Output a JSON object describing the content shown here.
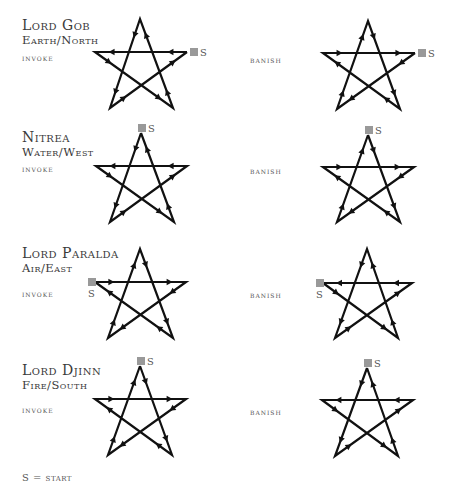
{
  "legend": "S = start",
  "start_marker": {
    "label": "S",
    "color": "#999999"
  },
  "line_color": "#111111",
  "rows": [
    {
      "title": "Lord Gob",
      "subtitle": "Earth/North",
      "invoke": {
        "label": "invoke",
        "start": "right",
        "path": [
          "right",
          "left",
          "br",
          "top",
          "bl",
          "right"
        ],
        "points": {
          "top": [
            140,
            19
          ],
          "left": [
            95,
            52
          ],
          "right": [
            187,
            52
          ],
          "bl": [
            110,
            108
          ],
          "br": [
            173,
            108
          ]
        },
        "s_pos": [
          190,
          48
        ],
        "s_text": [
          200,
          56
        ]
      },
      "banish": {
        "label": "banish",
        "start": "right",
        "path": [
          "right",
          "bl",
          "top",
          "br",
          "left",
          "right"
        ],
        "points": {
          "top": [
            368,
            21
          ],
          "left": [
            323,
            53
          ],
          "right": [
            415,
            53
          ],
          "bl": [
            337,
            109
          ],
          "br": [
            400,
            109
          ]
        },
        "s_pos": [
          418,
          49
        ],
        "s_text": [
          428,
          57
        ]
      }
    },
    {
      "title": "Nitrea",
      "subtitle": "Water/West",
      "invoke": {
        "label": "invoke",
        "start": "top",
        "path": [
          "top",
          "bl",
          "right",
          "left",
          "br",
          "top"
        ],
        "points": {
          "top": [
            141,
            133
          ],
          "left": [
            96,
            166
          ],
          "right": [
            187,
            166
          ],
          "bl": [
            110,
            222
          ],
          "br": [
            174,
            222
          ]
        },
        "s_pos": [
          138,
          124
        ],
        "s_text": [
          148,
          132
        ]
      },
      "banish": {
        "label": "banish",
        "start": "top",
        "path": [
          "top",
          "br",
          "left",
          "right",
          "bl",
          "top"
        ],
        "points": {
          "top": [
            368,
            135
          ],
          "left": [
            323,
            167
          ],
          "right": [
            414,
            167
          ],
          "bl": [
            337,
            222
          ],
          "br": [
            400,
            222
          ]
        },
        "s_pos": [
          365,
          126
        ],
        "s_text": [
          375,
          134
        ]
      }
    },
    {
      "title": "Lord Paralda",
      "subtitle": "Air/East",
      "invoke": {
        "label": "invoke",
        "start": "left",
        "path": [
          "left",
          "right",
          "bl",
          "top",
          "br",
          "left"
        ],
        "points": {
          "top": [
            140,
            249
          ],
          "left": [
            95,
            282
          ],
          "right": [
            186,
            282
          ],
          "bl": [
            108,
            338
          ],
          "br": [
            173,
            338
          ]
        },
        "s_pos": [
          88,
          278
        ],
        "s_text": [
          88,
          297
        ]
      },
      "banish": {
        "label": "banish",
        "start": "left",
        "path": [
          "left",
          "br",
          "top",
          "bl",
          "right",
          "left"
        ],
        "points": {
          "top": [
            367,
            249
          ],
          "left": [
            323,
            283
          ],
          "right": [
            412,
            283
          ],
          "bl": [
            335,
            338
          ],
          "br": [
            398,
            338
          ]
        },
        "s_pos": [
          316,
          279
        ],
        "s_text": [
          316,
          298
        ]
      }
    },
    {
      "title": "Lord Djinn",
      "subtitle": "Fire/South",
      "invoke": {
        "label": "invoke",
        "start": "top",
        "path": [
          "top",
          "br",
          "left",
          "right",
          "bl",
          "top"
        ],
        "points": {
          "top": [
            140,
            366
          ],
          "left": [
            95,
            399
          ],
          "right": [
            186,
            399
          ],
          "bl": [
            108,
            455
          ],
          "br": [
            172,
            455
          ]
        },
        "s_pos": [
          137,
          357
        ],
        "s_text": [
          147,
          365
        ]
      },
      "banish": {
        "label": "banish",
        "start": "top",
        "path": [
          "top",
          "bl",
          "right",
          "left",
          "br",
          "top"
        ],
        "points": {
          "top": [
            367,
            368
          ],
          "left": [
            322,
            400
          ],
          "right": [
            413,
            400
          ],
          "bl": [
            335,
            456
          ],
          "br": [
            398,
            456
          ]
        },
        "s_pos": [
          364,
          359
        ],
        "s_text": [
          374,
          367
        ]
      }
    }
  ]
}
